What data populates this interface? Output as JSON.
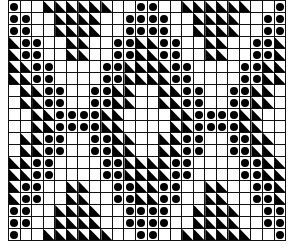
{
  "title": "",
  "legend": {
    "D": "dot-stitch",
    "T": "half-black-triangle",
    ".": "empty"
  },
  "colors": {
    "ink": "#000000",
    "background": "#ffffff",
    "grid_line": "#111111"
  },
  "grid": {
    "columns": 24,
    "rows": 20,
    "repeat_width": 12,
    "pattern": [
      "D..TTTTTT..DD..TTTTTT..D",
      "DD..TTTT..DDDD..TTTT..DD",
      "DD..TTTT..DDDD..TTTT..DD",
      "TDD..TT..DDTTDD..TT..DDT",
      "TDD..TT..DDTTDD..TT..DDT",
      "TTDD....DDTTTTDD....DDTT",
      "TTDD....DDTTTTDD....DDTT",
      ".TTDD..DDTT..TTDD..DDTT.",
      ".TTDD..DDTT..TTDD..DDTT.",
      "..TTDDDDTT....TTDDDDTT..",
      "..TTDDDDTT....TTDDDDTT..",
      ".TTDD..DDTT..TTDD..DDTT.",
      ".TTDD..DDTT..TTDD..DDTT.",
      "TTDD....DDTTTTDD....DDTT",
      "TTDD....DDTTTTDD....DDTT",
      "TDD..TT..DDTTDD..TT..DDT",
      "TDD..TT..DDTTDD..TT..DDT",
      "DD..TTTT..DDDD..TTTT..DD",
      "DD..TTTT..DDDD..TTTT..DD",
      "D..TTTTTT..DD..TTTTTT..D"
    ]
  }
}
